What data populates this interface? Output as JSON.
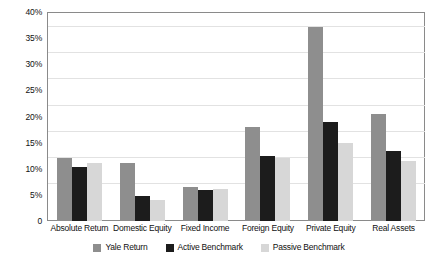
{
  "chart_data": {
    "type": "bar",
    "title": "",
    "xlabel": "",
    "ylabel": "",
    "ylim": [
      0,
      40
    ],
    "ytick_labels": [
      "40%",
      "35%",
      "30%",
      "25%",
      "20%",
      "15%",
      "10%",
      "5%",
      "0"
    ],
    "ytick_values": [
      40,
      35,
      30,
      25,
      20,
      15,
      10,
      5,
      0
    ],
    "grid": true,
    "legend_position": "bottom",
    "categories": [
      "Absolute Return",
      "Domestic Equity",
      "Fixed Income",
      "Foreign Equity",
      "Private Equity",
      "Real Assets"
    ],
    "series": [
      {
        "name": "Yale Return",
        "color": "#8e8e8e",
        "values": [
          12.0,
          11.1,
          6.6,
          17.9,
          37.1,
          20.4
        ]
      },
      {
        "name": "Active Benchmark",
        "color": "#1c1c1c",
        "values": [
          10.3,
          4.8,
          6.0,
          12.5,
          19.0,
          13.4
        ]
      },
      {
        "name": "Passive Benchmark",
        "color": "#d7d7d7",
        "values": [
          11.1,
          4.0,
          6.1,
          12.0,
          15.0,
          11.4
        ]
      }
    ]
  },
  "legend": {
    "items": [
      {
        "label": "Yale Return"
      },
      {
        "label": "Active Benchmark"
      },
      {
        "label": "Passive Benchmark"
      }
    ]
  }
}
